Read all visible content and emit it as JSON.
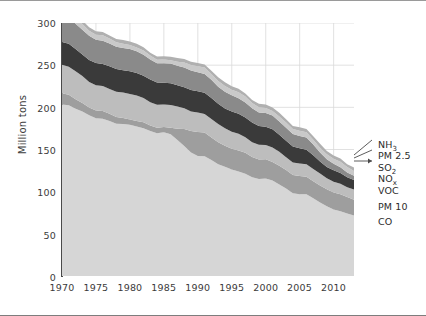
{
  "chart_data": {
    "type": "area",
    "stacked": true,
    "title": "",
    "xlabel": "",
    "ylabel": "Million tons",
    "xlim": [
      1970,
      2013
    ],
    "ylim": [
      0,
      300
    ],
    "ytick_labels": [
      "0",
      "50",
      "100",
      "150",
      "200",
      "250",
      "300"
    ],
    "yticks": [
      0,
      50,
      100,
      150,
      200,
      250,
      300
    ],
    "xtick_labels": [
      "1970",
      "1975",
      "1980",
      "1985",
      "1990",
      "1995",
      "2000",
      "2005",
      "2010"
    ],
    "xticks": [
      1970,
      1975,
      1980,
      1985,
      1990,
      1995,
      2000,
      2005,
      2010
    ],
    "grid": "vertical-and-horizontal-light",
    "legend_position": "right-outside",
    "x": [
      1970,
      1975,
      1980,
      1985,
      1990,
      1995,
      2000,
      2005,
      2010,
      2013
    ],
    "series": [
      {
        "name": "CO",
        "color": "#d6d6d6",
        "stack_order": 1,
        "values": [
          204,
          188,
          178,
          170,
          144,
          126,
          114,
          98,
          80,
          72
        ]
      },
      {
        "name": "PM 10",
        "color": "#9e9e9e",
        "stack_order": 2,
        "values": [
          13,
          9,
          7,
          6,
          28,
          25,
          23,
          21,
          20,
          19
        ]
      },
      {
        "name": "VOC",
        "color": "#bdbdbd",
        "stack_order": 3,
        "values": [
          34,
          30,
          30,
          27,
          23,
          20,
          17,
          15,
          13,
          12
        ]
      },
      {
        "name": "NOx",
        "color": "#3a3a3a",
        "stack_order": 4,
        "values": [
          27,
          26,
          27,
          26,
          25,
          24,
          22,
          18,
          13,
          11
        ]
      },
      {
        "name": "SO2",
        "color": "#8a8a8a",
        "stack_order": 5,
        "values": [
          31,
          28,
          26,
          23,
          23,
          19,
          16,
          15,
          8,
          5
        ]
      },
      {
        "name": "PM 2.5",
        "color": "#c9c9c9",
        "stack_order": 6,
        "values": [
          8,
          6,
          5,
          4,
          7,
          7,
          6,
          6,
          6,
          6
        ]
      },
      {
        "name": "NH3",
        "color": "#b0b0b0",
        "stack_order": 7,
        "values": [
          4,
          4,
          4,
          4,
          4,
          4,
          4,
          4,
          4,
          4
        ]
      }
    ],
    "totals": [
      321,
      291,
      277,
      260,
      254,
      225,
      202,
      177,
      144,
      125
    ],
    "annotations": []
  },
  "axes": {
    "y_title": "Million tons",
    "y_ticks": [
      "300",
      "250",
      "200",
      "150",
      "100",
      "50",
      "0"
    ],
    "x_ticks": [
      "1970",
      "1975",
      "1980",
      "1985",
      "1990",
      "1995",
      "2000",
      "2005",
      "2010"
    ]
  },
  "legend": {
    "items": [
      {
        "label": "NH3",
        "base": "NH",
        "sub": "3",
        "color": "#b0b0b0"
      },
      {
        "label": "PM 2.5",
        "base": "PM 2.5",
        "sub": "",
        "color": "#c9c9c9"
      },
      {
        "label": "SO2",
        "base": "SO",
        "sub": "2",
        "color": "#8a8a8a"
      },
      {
        "label": "NOx",
        "base": "NO",
        "sub": "x",
        "color": "#3a3a3a"
      },
      {
        "label": "VOC",
        "base": "VOC",
        "sub": "",
        "color": "#bdbdbd"
      },
      {
        "label": "PM 10",
        "base": "PM 10",
        "sub": "",
        "color": "#9e9e9e"
      },
      {
        "label": "CO",
        "base": "CO",
        "sub": "",
        "color": "#d6d6d6"
      }
    ]
  },
  "colors": {
    "background": "#ffffff",
    "axis": "#4a4a4a",
    "grid": "#d9d9d9",
    "text": "#2b2b2b",
    "frame_top": "#9a9a9a",
    "frame_bottom": "#7d7d7d"
  }
}
